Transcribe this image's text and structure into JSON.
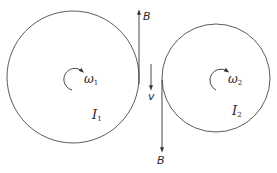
{
  "diagram": {
    "type": "two-disk belt / tangent contact",
    "stroke_color": "#333333",
    "left_disk": {
      "angular_velocity_label": "ω",
      "angular_velocity_sub": "1",
      "inertia_label": "I",
      "inertia_sub": "1"
    },
    "right_disk": {
      "angular_velocity_label": "ω",
      "angular_velocity_sub": "2",
      "inertia_label": "I",
      "inertia_sub": "2"
    },
    "force_up": {
      "label": "B"
    },
    "force_down": {
      "label": "B"
    },
    "velocity": {
      "label": "v"
    }
  }
}
